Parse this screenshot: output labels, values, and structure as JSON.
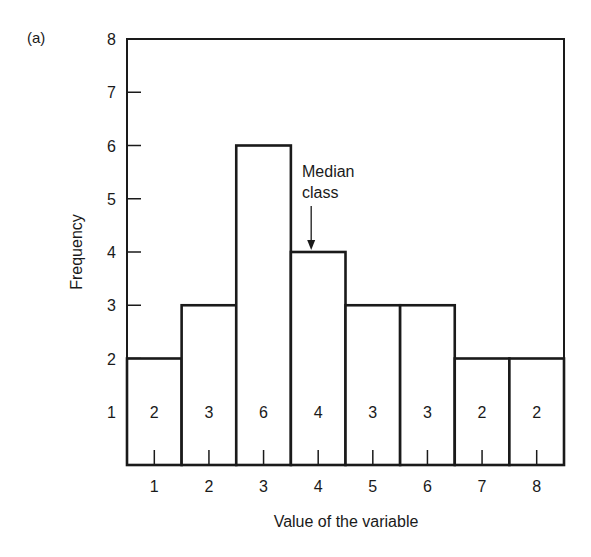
{
  "panel_label": "(a)",
  "chart_data": {
    "type": "bar",
    "title": "",
    "subtitle": "",
    "xlabel": "Value of the variable",
    "ylabel": "Frequency",
    "categories": [
      "1",
      "2",
      "3",
      "4",
      "5",
      "6",
      "7",
      "8"
    ],
    "values": [
      2,
      3,
      6,
      4,
      3,
      3,
      2,
      2
    ],
    "bar_labels": [
      "2",
      "3",
      "6",
      "4",
      "3",
      "3",
      "2",
      "2"
    ],
    "ylim": [
      0,
      8
    ],
    "yticks": [
      "1",
      "2",
      "3",
      "4",
      "5",
      "6",
      "7",
      "8"
    ],
    "grid": false,
    "legend": null,
    "histogram": true,
    "annotations": [
      {
        "text_lines": [
          "Median",
          "class"
        ],
        "target_category": "4",
        "arrow": "down"
      }
    ],
    "colors": {
      "line": "#1a1a1a",
      "fill": "#ffffff"
    }
  }
}
